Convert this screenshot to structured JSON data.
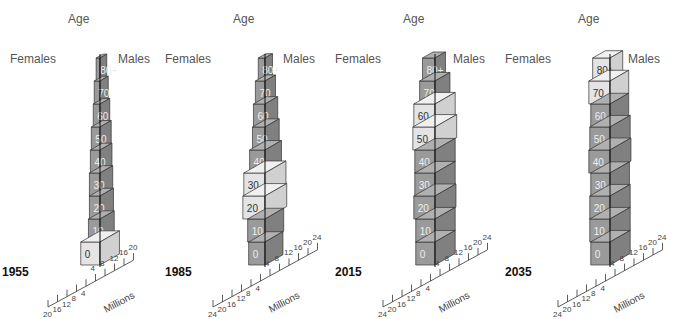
{
  "figure": {
    "age_label": "Age",
    "females_label": "Females",
    "males_label": "Males",
    "units_label": "Millions"
  },
  "colors": {
    "light": "#e4e4e4",
    "medium": "#9a9a9a",
    "dark": "#808080",
    "edge": "#333333"
  },
  "chart_data": [
    {
      "type": "bar",
      "subtype": "population-pyramid-3d",
      "title": "1955",
      "categories": [
        "0",
        "10",
        "20",
        "30",
        "40",
        "50",
        "60",
        "70",
        "80+"
      ],
      "xlabel": "Millions",
      "ylabel": "Age",
      "x_ticks": [
        20,
        16,
        12,
        8,
        4,
        4,
        8,
        12,
        16,
        20
      ],
      "xlim": [
        -20,
        20
      ],
      "series": [
        {
          "name": "Females",
          "values": [
            20,
            12,
            11,
            11,
            10,
            9,
            7,
            6,
            4
          ]
        },
        {
          "name": "Males",
          "values": [
            20,
            13,
            12,
            11,
            10,
            9,
            7,
            5,
            3
          ]
        }
      ],
      "highlighted_cohorts": [
        "0"
      ]
    },
    {
      "type": "bar",
      "subtype": "population-pyramid-3d",
      "title": "1985",
      "categories": [
        "0",
        "10",
        "20",
        "30",
        "40",
        "50",
        "60",
        "70",
        "80+"
      ],
      "xlabel": "Millions",
      "ylabel": "Age",
      "x_ticks": [
        24,
        20,
        16,
        12,
        8,
        4,
        4,
        8,
        12,
        16,
        20,
        24
      ],
      "xlim": [
        -24,
        24
      ],
      "series": [
        {
          "name": "Females",
          "values": [
            17,
            18,
            23,
            22,
            16,
            13,
            12,
            10,
            7
          ]
        },
        {
          "name": "Males",
          "values": [
            18,
            19,
            23,
            22,
            16,
            13,
            11,
            8,
            4
          ]
        }
      ],
      "highlighted_cohorts": [
        "20",
        "30"
      ]
    },
    {
      "type": "bar",
      "subtype": "population-pyramid-3d",
      "title": "2015",
      "categories": [
        "0",
        "10",
        "20",
        "30",
        "40",
        "50",
        "60",
        "70",
        "80+"
      ],
      "xlabel": "Millions",
      "ylabel": "Age",
      "x_ticks": [
        24,
        20,
        16,
        12,
        8,
        4,
        4,
        8,
        12,
        16,
        20,
        24
      ],
      "xlim": [
        -24,
        24
      ],
      "series": [
        {
          "name": "Females",
          "values": [
            20,
            20,
            22,
            21,
            21,
            23,
            22,
            16,
            13
          ]
        },
        {
          "name": "Males",
          "values": [
            21,
            21,
            22,
            21,
            21,
            23,
            21,
            14,
            8
          ]
        }
      ],
      "highlighted_cohorts": [
        "50",
        "60"
      ]
    },
    {
      "type": "bar",
      "subtype": "population-pyramid-3d",
      "title": "2035",
      "categories": [
        "0",
        "10",
        "20",
        "30",
        "40",
        "50",
        "60",
        "70",
        "80+"
      ],
      "xlabel": "Millions",
      "ylabel": "Age",
      "x_ticks": [
        24,
        20,
        16,
        12,
        8,
        4,
        4,
        8,
        12,
        16,
        20,
        24
      ],
      "xlim": [
        -24,
        24
      ],
      "series": [
        {
          "name": "Females",
          "values": [
            20,
            21,
            21,
            20,
            22,
            21,
            20,
            22,
            18
          ]
        },
        {
          "name": "Males",
          "values": [
            21,
            21,
            21,
            20,
            22,
            21,
            19,
            19,
            11
          ]
        }
      ],
      "highlighted_cohorts": [
        "70",
        "80+"
      ]
    }
  ]
}
